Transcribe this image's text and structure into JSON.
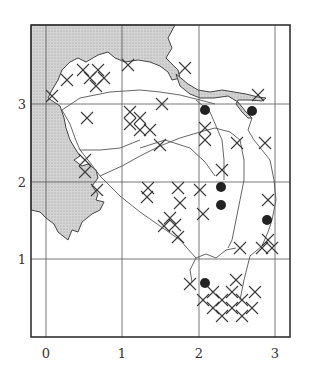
{
  "figure": {
    "x_ticks": [
      {
        "label": "0",
        "x": 46
      },
      {
        "label": "1",
        "x": 122
      },
      {
        "label": "2",
        "x": 199
      },
      {
        "label": "3",
        "x": 275
      }
    ],
    "y_ticks": [
      {
        "label": "3",
        "y": 104
      },
      {
        "label": "2",
        "y": 182
      },
      {
        "label": "1",
        "y": 259
      }
    ],
    "frame": {
      "left": 31,
      "top": 25,
      "right": 290,
      "bottom": 337
    },
    "colors": {
      "land_fill": "#c8c8c8",
      "line": "#333333",
      "dot": "#222222",
      "background": "#ffffff"
    },
    "legend": {
      "dot_marker": "filled-circle",
      "cross_marker": "x-cross"
    },
    "dots": [
      {
        "x": 205,
        "y": 110
      },
      {
        "x": 252,
        "y": 111
      },
      {
        "x": 221,
        "y": 187
      },
      {
        "x": 221,
        "y": 205
      },
      {
        "x": 267,
        "y": 220
      },
      {
        "x": 205,
        "y": 283
      }
    ],
    "crosses": [
      {
        "x": 52,
        "y": 96
      },
      {
        "x": 83,
        "y": 70
      },
      {
        "x": 98,
        "y": 70
      },
      {
        "x": 90,
        "y": 78
      },
      {
        "x": 104,
        "y": 78
      },
      {
        "x": 96,
        "y": 86
      },
      {
        "x": 128,
        "y": 65
      },
      {
        "x": 67,
        "y": 80
      },
      {
        "x": 87,
        "y": 118
      },
      {
        "x": 85,
        "y": 160
      },
      {
        "x": 85,
        "y": 172
      },
      {
        "x": 97,
        "y": 190
      },
      {
        "x": 130,
        "y": 112
      },
      {
        "x": 130,
        "y": 124
      },
      {
        "x": 140,
        "y": 118
      },
      {
        "x": 140,
        "y": 130
      },
      {
        "x": 150,
        "y": 130
      },
      {
        "x": 160,
        "y": 145
      },
      {
        "x": 162,
        "y": 104
      },
      {
        "x": 185,
        "y": 68
      },
      {
        "x": 205,
        "y": 128
      },
      {
        "x": 205,
        "y": 140
      },
      {
        "x": 237,
        "y": 143
      },
      {
        "x": 265,
        "y": 143
      },
      {
        "x": 258,
        "y": 95
      },
      {
        "x": 222,
        "y": 170
      },
      {
        "x": 148,
        "y": 188
      },
      {
        "x": 178,
        "y": 188
      },
      {
        "x": 147,
        "y": 197
      },
      {
        "x": 200,
        "y": 190
      },
      {
        "x": 203,
        "y": 214
      },
      {
        "x": 180,
        "y": 203
      },
      {
        "x": 170,
        "y": 218
      },
      {
        "x": 175,
        "y": 225
      },
      {
        "x": 178,
        "y": 237
      },
      {
        "x": 164,
        "y": 226
      },
      {
        "x": 268,
        "y": 200
      },
      {
        "x": 268,
        "y": 240
      },
      {
        "x": 262,
        "y": 248
      },
      {
        "x": 272,
        "y": 248
      },
      {
        "x": 240,
        "y": 248
      },
      {
        "x": 190,
        "y": 284
      },
      {
        "x": 203,
        "y": 300
      },
      {
        "x": 213,
        "y": 292
      },
      {
        "x": 222,
        "y": 300
      },
      {
        "x": 232,
        "y": 292
      },
      {
        "x": 242,
        "y": 300
      },
      {
        "x": 213,
        "y": 308
      },
      {
        "x": 232,
        "y": 308
      },
      {
        "x": 222,
        "y": 316
      },
      {
        "x": 242,
        "y": 316
      },
      {
        "x": 252,
        "y": 308
      },
      {
        "x": 236,
        "y": 280
      },
      {
        "x": 255,
        "y": 292
      }
    ]
  }
}
